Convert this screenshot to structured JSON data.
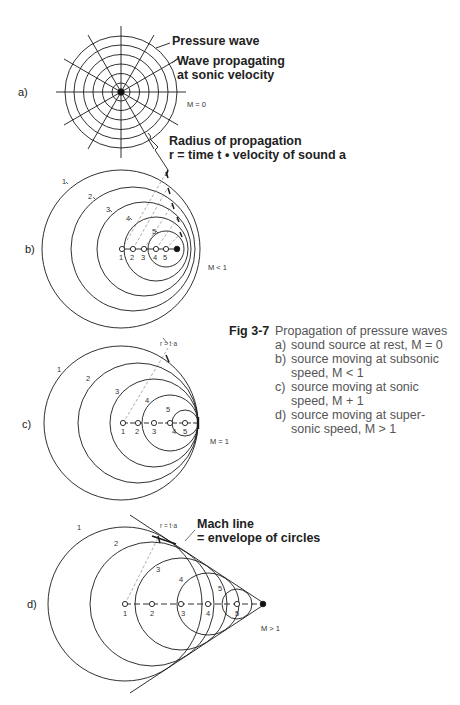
{
  "figure": {
    "number": "Fig 3-7",
    "title": "Propagation of pressure waves",
    "caption_items": [
      {
        "letter": "a)",
        "line1": "sound source at rest, M = 0",
        "line2": ""
      },
      {
        "letter": "b)",
        "line1": "source moving at subsonic",
        "line2": "speed, M < 1"
      },
      {
        "letter": "c)",
        "line1": "source moving at sonic",
        "line2": "speed, M + 1"
      },
      {
        "letter": "d)",
        "line1": "source moving at super-",
        "line2": "sonic speed, M > 1"
      }
    ]
  },
  "panel_a": {
    "label": "a)",
    "mach": "M = 0",
    "annotations": {
      "pressure_wave": "Pressure wave",
      "propagating_1": "Wave propagating",
      "propagating_2": "at sonic velocity",
      "radius_1": "Radius of propagation",
      "radius_2": "r = time t • velocity of sound a"
    }
  },
  "panel_b": {
    "label": "b)",
    "mach": "M < 1",
    "circle_labels": [
      "1",
      "2",
      "3",
      "4",
      "5"
    ],
    "point_labels": [
      "1",
      "2",
      "3",
      "4",
      "5"
    ]
  },
  "panel_c": {
    "label": "c)",
    "mach": "M = 1",
    "radius_label": "r = t·a",
    "circle_labels": [
      "1",
      "2",
      "3",
      "4",
      "5"
    ],
    "point_labels": [
      "1",
      "2",
      "3",
      "4",
      "5"
    ]
  },
  "panel_d": {
    "label": "d)",
    "mach": "M > 1",
    "radius_label": "r = t·a",
    "mach_line_1": "Mach line",
    "mach_line_2": "= envelope of circles",
    "circle_labels": [
      "1",
      "2",
      "3",
      "4",
      "5"
    ],
    "point_labels": [
      "1",
      "2",
      "3",
      "4",
      "5"
    ]
  },
  "colors": {
    "line": "#1a1a1a",
    "dashed": "#777777",
    "caption": "#555555"
  }
}
